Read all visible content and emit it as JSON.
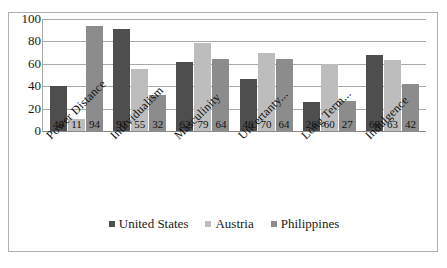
{
  "chart_data": {
    "type": "bar",
    "title": "",
    "xlabel": "",
    "ylabel": "",
    "ylim": [
      0,
      100
    ],
    "yticks": [
      100,
      80,
      60,
      40,
      20,
      0
    ],
    "grid": true,
    "legend_position": "bottom",
    "categories": [
      "Power Distance",
      "Individualism",
      "Masculinity",
      "Uncertanty...",
      "Long Term...",
      "Indulgence"
    ],
    "series": [
      {
        "name": "United States",
        "color": "#4e4e4e",
        "values": [
          40,
          91,
          62,
          46,
          26,
          68
        ]
      },
      {
        "name": "Austria",
        "color": "#bdbdbd",
        "values": [
          11,
          55,
          79,
          70,
          60,
          63
        ]
      },
      {
        "name": "Philippines",
        "color": "#8c8c8c",
        "values": [
          94,
          32,
          64,
          64,
          27,
          42
        ]
      }
    ]
  }
}
